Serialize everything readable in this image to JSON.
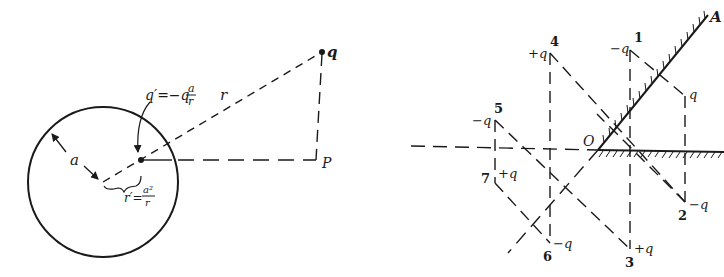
{
  "figure": {
    "ink_color": "#1a1a1a",
    "background": "#ffffff",
    "left_panel": {
      "title": "Image charge for a grounded conducting sphere",
      "sphere": {
        "cx": 103,
        "cy": 182,
        "r": 75
      },
      "radius_label": "a",
      "real_charge": {
        "label": "q",
        "x": 322,
        "y": 52
      },
      "image_charge": {
        "label": "q′=−q",
        "fraction_num": "a",
        "fraction_den": "r",
        "x": 141,
        "y": 160
      },
      "distance_label": "r",
      "image_distance": {
        "prefix": "r′=",
        "fraction_num": "a²",
        "fraction_den": "r"
      },
      "field_point": {
        "label": "P",
        "x": 316,
        "y": 160
      }
    },
    "right_panel": {
      "title": "Image charges for two conducting planes at 45°",
      "origin": {
        "label": "O",
        "x": 598,
        "y": 150
      },
      "plane_label": "A",
      "charges": [
        {
          "index": "1",
          "charge": "−q",
          "x": 630,
          "y": 50
        },
        {
          "index": "",
          "charge": "q",
          "x": 685,
          "y": 96
        },
        {
          "index": "2",
          "charge": "−q",
          "x": 685,
          "y": 202
        },
        {
          "index": "3",
          "charge": "+q",
          "x": 630,
          "y": 249
        },
        {
          "index": "4",
          "charge": "+q",
          "x": 550,
          "y": 53
        },
        {
          "index": "5",
          "charge": "−q",
          "x": 495,
          "y": 120
        },
        {
          "index": "6",
          "charge": "−q",
          "x": 550,
          "y": 243
        },
        {
          "index": "7",
          "charge": "+q",
          "x": 495,
          "y": 183
        }
      ]
    }
  }
}
